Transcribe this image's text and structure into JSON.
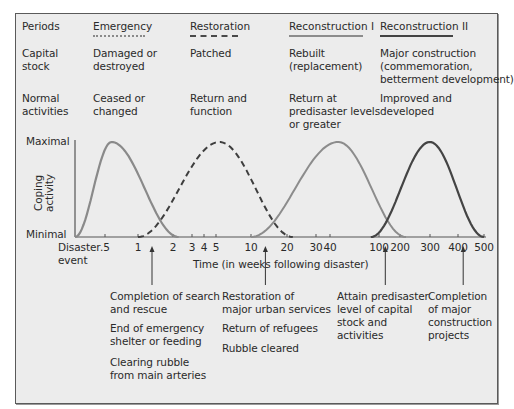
{
  "table": {
    "row_labels": {
      "periods": "Periods",
      "capital_stock": "Capital\nstock",
      "normal_activities": "Normal\nactivities"
    },
    "periods": [
      {
        "name": "Emergency",
        "capital_stock": "Damaged or\ndestroyed",
        "normal_activities": "Ceased or\nchanged",
        "line_style": "dotted-gray",
        "color": "#8a8a8a"
      },
      {
        "name": "Restoration",
        "capital_stock": "Patched",
        "normal_activities": "Return and\nfunction",
        "line_style": "dashed",
        "color": "#4a4a4a"
      },
      {
        "name": "Reconstruction I",
        "capital_stock": "Rebuilt\n(replacement)",
        "normal_activities": "Return at\npredisaster levels\nor greater",
        "line_style": "solid-gray",
        "color": "#8c8c8c"
      },
      {
        "name": "Reconstruction II",
        "capital_stock": "Major construction\n(commemoration,\nbetterment development)",
        "normal_activities": "Improved and\ndeveloped",
        "line_style": "solid-dark",
        "color": "#444444"
      }
    ]
  },
  "chart_data": {
    "type": "line",
    "title": "",
    "xlabel": "Time (in weeks following disaster)",
    "ylabel": "Coping activity",
    "y_ticks": [
      "Minimal",
      "Maximal"
    ],
    "x_origin_label": "Disaster\nevent",
    "x_ticks": [
      ".5",
      "1",
      "2",
      "3",
      "4",
      "5",
      "10",
      "20",
      "30",
      "40",
      "100",
      "200",
      "300",
      "400",
      "500"
    ],
    "x_tick_values": [
      0.5,
      1,
      2,
      3,
      4,
      5,
      10,
      20,
      30,
      40,
      100,
      200,
      300,
      400,
      500
    ],
    "x_scale": "log (approximate)",
    "ylim": [
      0,
      1
    ],
    "series": [
      {
        "name": "Emergency",
        "style": "solid-light",
        "start_weeks": 0,
        "peak_weeks": 0.6,
        "end_weeks": 2.3,
        "peak_value": 1
      },
      {
        "name": "Restoration",
        "style": "dashed",
        "start_weeks": 1,
        "peak_weeks": 5.5,
        "end_weeks": 22,
        "peak_value": 1
      },
      {
        "name": "Reconstruction I",
        "style": "solid-medium",
        "start_weeks": 10,
        "peak_weeks": 50,
        "end_weeks": 220,
        "peak_value": 1
      },
      {
        "name": "Reconstruction II",
        "style": "solid-dark",
        "start_weeks": 90,
        "peak_weeks": 300,
        "end_weeks": 500,
        "peak_value": 1
      }
    ],
    "annotations": [
      {
        "at_weeks": 1.4,
        "text": [
          "Completion of search\nand rescue",
          "End of emergency\nshelter or feeding",
          "Clearing rubble\nfrom main arteries"
        ]
      },
      {
        "at_weeks": 14,
        "text": [
          "Restoration of\nmajor urban services",
          "Return of refugees",
          "Rubble cleared"
        ]
      },
      {
        "at_weeks": 130,
        "text": [
          "Attain predisaster\nlevel of capital\nstock and\nactivities"
        ]
      },
      {
        "at_weeks": 420,
        "text": [
          "Completion\nof major\nconstruction\nprojects"
        ]
      }
    ],
    "grid": false,
    "legend": "top (period table headers)"
  }
}
